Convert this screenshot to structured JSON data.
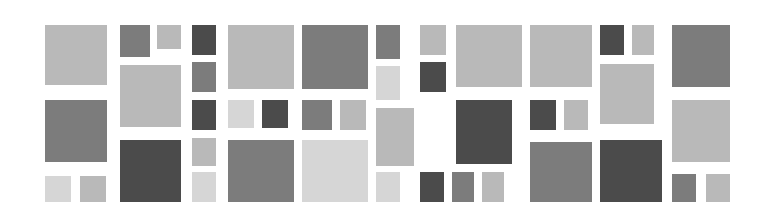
{
  "figure": {
    "background_color": "#ffffff",
    "width": 763,
    "height": 220
  },
  "palette": {
    "very_light": "#d6d6d6",
    "light": "#b9b9b9",
    "mid": "#7c7c7c",
    "dark": "#4b4b4b"
  },
  "chart_data": {
    "type": "heatmap",
    "subtitle": "",
    "xlabel": "",
    "ylabel": "",
    "grid": false,
    "legend_position": "none",
    "xlim": [
      0,
      763
    ],
    "ylim": [
      0,
      220
    ],
    "value_scale": {
      "levels": [
        1,
        2,
        3,
        4
      ],
      "level_colors": [
        "#d6d6d6",
        "#b9b9b9",
        "#7c7c7c",
        "#4b4b4b"
      ],
      "level_labels": [
        "very light",
        "light",
        "mid",
        "dark"
      ]
    },
    "units": "pixels",
    "tiles": [
      {
        "id": "t01",
        "x": 45,
        "y": 25,
        "w": 62,
        "h": 60,
        "level": 2,
        "color": "#b9b9b9"
      },
      {
        "id": "t02",
        "x": 45,
        "y": 100,
        "w": 62,
        "h": 62,
        "level": 3,
        "color": "#7c7c7c"
      },
      {
        "id": "t03",
        "x": 45,
        "y": 176,
        "w": 26,
        "h": 26,
        "level": 1,
        "color": "#d6d6d6"
      },
      {
        "id": "t04",
        "x": 80,
        "y": 176,
        "w": 26,
        "h": 26,
        "level": 2,
        "color": "#b9b9b9"
      },
      {
        "id": "t05",
        "x": 120,
        "y": 25,
        "w": 30,
        "h": 32,
        "level": 3,
        "color": "#7c7c7c"
      },
      {
        "id": "t06",
        "x": 157,
        "y": 25,
        "w": 24,
        "h": 24,
        "level": 2,
        "color": "#b9b9b9"
      },
      {
        "id": "t07",
        "x": 120,
        "y": 65,
        "w": 61,
        "h": 62,
        "level": 2,
        "color": "#b9b9b9"
      },
      {
        "id": "t08",
        "x": 120,
        "y": 140,
        "w": 61,
        "h": 62,
        "level": 4,
        "color": "#4b4b4b"
      },
      {
        "id": "t09",
        "x": 192,
        "y": 25,
        "w": 24,
        "h": 30,
        "level": 4,
        "color": "#4b4b4b"
      },
      {
        "id": "t10",
        "x": 192,
        "y": 62,
        "w": 24,
        "h": 30,
        "level": 3,
        "color": "#7c7c7c"
      },
      {
        "id": "t11",
        "x": 192,
        "y": 100,
        "w": 24,
        "h": 30,
        "level": 4,
        "color": "#4b4b4b"
      },
      {
        "id": "t12",
        "x": 192,
        "y": 138,
        "w": 24,
        "h": 28,
        "level": 2,
        "color": "#b9b9b9"
      },
      {
        "id": "t13",
        "x": 192,
        "y": 172,
        "w": 24,
        "h": 30,
        "level": 1,
        "color": "#d6d6d6"
      },
      {
        "id": "t14",
        "x": 228,
        "y": 25,
        "w": 66,
        "h": 64,
        "level": 2,
        "color": "#b9b9b9"
      },
      {
        "id": "t15",
        "x": 228,
        "y": 100,
        "w": 26,
        "h": 28,
        "level": 1,
        "color": "#d6d6d6"
      },
      {
        "id": "t16",
        "x": 262,
        "y": 100,
        "w": 26,
        "h": 28,
        "level": 4,
        "color": "#4b4b4b"
      },
      {
        "id": "t17",
        "x": 228,
        "y": 140,
        "w": 66,
        "h": 62,
        "level": 3,
        "color": "#7c7c7c"
      },
      {
        "id": "t18",
        "x": 302,
        "y": 25,
        "w": 66,
        "h": 64,
        "level": 3,
        "color": "#7c7c7c"
      },
      {
        "id": "t19",
        "x": 302,
        "y": 100,
        "w": 30,
        "h": 30,
        "level": 3,
        "color": "#7c7c7c"
      },
      {
        "id": "t20",
        "x": 340,
        "y": 100,
        "w": 26,
        "h": 30,
        "level": 2,
        "color": "#b9b9b9"
      },
      {
        "id": "t21",
        "x": 302,
        "y": 140,
        "w": 66,
        "h": 62,
        "level": 1,
        "color": "#d6d6d6"
      },
      {
        "id": "t22",
        "x": 376,
        "y": 25,
        "w": 24,
        "h": 34,
        "level": 3,
        "color": "#7c7c7c"
      },
      {
        "id": "t23",
        "x": 376,
        "y": 66,
        "w": 24,
        "h": 34,
        "level": 1,
        "color": "#d6d6d6"
      },
      {
        "id": "t24",
        "x": 376,
        "y": 108,
        "w": 38,
        "h": 58,
        "level": 2,
        "color": "#b9b9b9"
      },
      {
        "id": "t25",
        "x": 376,
        "y": 172,
        "w": 24,
        "h": 30,
        "level": 1,
        "color": "#d6d6d6"
      },
      {
        "id": "t26",
        "x": 420,
        "y": 25,
        "w": 26,
        "h": 30,
        "level": 2,
        "color": "#b9b9b9"
      },
      {
        "id": "t27",
        "x": 420,
        "y": 62,
        "w": 26,
        "h": 30,
        "level": 4,
        "color": "#4b4b4b"
      },
      {
        "id": "t28",
        "x": 420,
        "y": 172,
        "w": 24,
        "h": 30,
        "level": 4,
        "color": "#4b4b4b"
      },
      {
        "id": "t29",
        "x": 452,
        "y": 172,
        "w": 22,
        "h": 30,
        "level": 3,
        "color": "#7c7c7c"
      },
      {
        "id": "t30",
        "x": 482,
        "y": 172,
        "w": 22,
        "h": 30,
        "level": 2,
        "color": "#b9b9b9"
      },
      {
        "id": "t31",
        "x": 456,
        "y": 25,
        "w": 66,
        "h": 62,
        "level": 2,
        "color": "#b9b9b9"
      },
      {
        "id": "t32",
        "x": 456,
        "y": 100,
        "w": 56,
        "h": 64,
        "level": 4,
        "color": "#4b4b4b"
      },
      {
        "id": "t33",
        "x": 530,
        "y": 25,
        "w": 62,
        "h": 62,
        "level": 2,
        "color": "#b9b9b9"
      },
      {
        "id": "t34",
        "x": 530,
        "y": 100,
        "w": 26,
        "h": 30,
        "level": 4,
        "color": "#4b4b4b"
      },
      {
        "id": "t35",
        "x": 564,
        "y": 100,
        "w": 24,
        "h": 30,
        "level": 2,
        "color": "#b9b9b9"
      },
      {
        "id": "t36",
        "x": 530,
        "y": 142,
        "w": 62,
        "h": 60,
        "level": 3,
        "color": "#7c7c7c"
      },
      {
        "id": "t37",
        "x": 600,
        "y": 25,
        "w": 24,
        "h": 30,
        "level": 4,
        "color": "#4b4b4b"
      },
      {
        "id": "t38",
        "x": 632,
        "y": 25,
        "w": 22,
        "h": 30,
        "level": 2,
        "color": "#b9b9b9"
      },
      {
        "id": "t39",
        "x": 600,
        "y": 64,
        "w": 54,
        "h": 60,
        "level": 2,
        "color": "#b9b9b9"
      },
      {
        "id": "t40",
        "x": 600,
        "y": 140,
        "w": 62,
        "h": 62,
        "level": 4,
        "color": "#4b4b4b"
      },
      {
        "id": "t41",
        "x": 672,
        "y": 25,
        "w": 58,
        "h": 62,
        "level": 3,
        "color": "#7c7c7c"
      },
      {
        "id": "t42",
        "x": 672,
        "y": 100,
        "w": 58,
        "h": 62,
        "level": 2,
        "color": "#b9b9b9"
      },
      {
        "id": "t43",
        "x": 672,
        "y": 174,
        "w": 24,
        "h": 28,
        "level": 3,
        "color": "#7c7c7c"
      },
      {
        "id": "t44",
        "x": 706,
        "y": 174,
        "w": 24,
        "h": 28,
        "level": 2,
        "color": "#b9b9b9"
      }
    ]
  }
}
